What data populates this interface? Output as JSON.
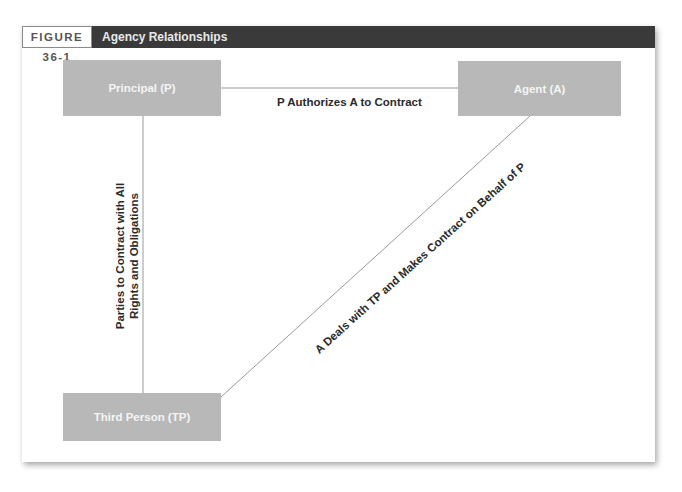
{
  "figure": {
    "number": "FIGURE 36-1",
    "title": "Agency Relationships"
  },
  "nodes": {
    "principal": "Principal (P)",
    "agent": "Agent (A)",
    "third_person": "Third Person (TP)"
  },
  "edges": {
    "principal_agent": "P Authorizes A to Contract",
    "principal_tp_line1": "Parties to Contract with All",
    "principal_tp_line2": "Rights and Obligations",
    "agent_tp": "A Deals with TP and Makes Contract on Behalf of P"
  },
  "colors": {
    "box": "#b8b8b8",
    "header": "#3a3a3a",
    "line": "#9a9a9a"
  }
}
